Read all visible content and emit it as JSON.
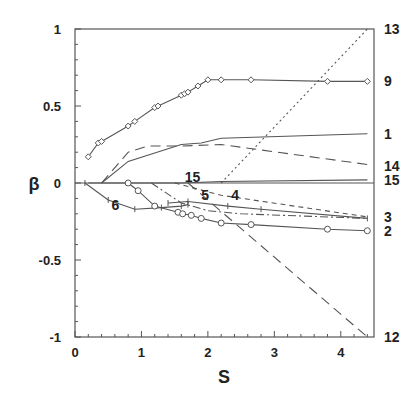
{
  "chart_data": {
    "type": "line",
    "title": "",
    "xlabel": "S",
    "ylabel": "β",
    "xlim": [
      0,
      4.5
    ],
    "ylim": [
      -1,
      1
    ],
    "x_ticks": [
      "0",
      "1",
      "2",
      "3",
      "4"
    ],
    "y_ticks": [
      "1",
      "0.5",
      "0",
      "-0.5",
      "-1"
    ],
    "grid": false,
    "legend": "curve labels at right edge and inline",
    "series": [
      {
        "name": "9",
        "style": "solid-diamond",
        "x": [
          0.2,
          0.35,
          0.4,
          0.8,
          0.9,
          1.2,
          1.25,
          1.6,
          1.65,
          1.7,
          1.85,
          2.0,
          2.2,
          2.65,
          3.8,
          4.4
        ],
        "y": [
          0.17,
          0.26,
          0.27,
          0.37,
          0.4,
          0.49,
          0.5,
          0.57,
          0.58,
          0.59,
          0.63,
          0.67,
          0.67,
          0.67,
          0.66,
          0.66
        ]
      },
      {
        "name": "1",
        "style": "solid",
        "x": [
          0.4,
          0.8,
          1.6,
          1.9,
          2.2,
          4.4
        ],
        "y": [
          0.0,
          0.14,
          0.25,
          0.26,
          0.29,
          0.32
        ]
      },
      {
        "name": "14",
        "style": "long-dash",
        "x": [
          0.4,
          0.8,
          1.1,
          1.6,
          2.2,
          4.4
        ],
        "y": [
          0.0,
          0.2,
          0.24,
          0.24,
          0.25,
          0.12
        ]
      },
      {
        "name": "15",
        "style": "solid",
        "x": [
          0.2,
          1.6,
          2.2,
          4.4
        ],
        "y": [
          0.0,
          0.0,
          0.01,
          0.02
        ]
      },
      {
        "name": "13",
        "style": "dotted",
        "x": [
          2.2,
          4.4
        ],
        "y": [
          0.0,
          1.0
        ]
      },
      {
        "name": "12",
        "style": "long-dash",
        "x": [
          1.7,
          4.4
        ],
        "y": [
          0.0,
          -1.0
        ]
      },
      {
        "name": "3",
        "style": "short-dash",
        "x": [
          1.5,
          2.2,
          4.4
        ],
        "y": [
          0.0,
          -0.08,
          -0.22
        ]
      },
      {
        "name": "4",
        "style": "solid-plus",
        "x": [
          1.4,
          1.7,
          2.3,
          2.8,
          4.4
        ],
        "y": [
          -0.13,
          -0.12,
          -0.15,
          -0.17,
          -0.23
        ]
      },
      {
        "name": "5",
        "style": "dash-dot",
        "x": [
          1.15,
          1.6,
          2.0,
          2.5,
          4.4
        ],
        "y": [
          0.0,
          -0.13,
          -0.18,
          -0.2,
          -0.23
        ]
      },
      {
        "name": "6",
        "style": "solid-plus",
        "x": [
          0.15,
          0.5,
          0.9,
          1.3,
          1.6,
          1.7
        ],
        "y": [
          0.0,
          -0.11,
          -0.17,
          -0.16,
          -0.15,
          -0.14
        ]
      },
      {
        "name": "2",
        "style": "solid-circle",
        "x": [
          0.8,
          0.95,
          1.2,
          1.55,
          1.62,
          1.75,
          1.9,
          2.2,
          2.65,
          3.8,
          4.4
        ],
        "y": [
          0.0,
          -0.05,
          -0.15,
          -0.19,
          -0.2,
          -0.21,
          -0.23,
          -0.26,
          -0.27,
          -0.3,
          -0.31
        ]
      }
    ],
    "right_labels": [
      {
        "text": "13",
        "y": 1.0
      },
      {
        "text": "9",
        "y": 0.66
      },
      {
        "text": "1",
        "y": 0.32
      },
      {
        "text": "14",
        "y": 0.11
      },
      {
        "text": "15",
        "y": 0.02
      },
      {
        "text": "3",
        "y": -0.22
      },
      {
        "text": "2",
        "y": -0.31
      },
      {
        "text": "12",
        "y": -1.0
      }
    ],
    "inline_labels": [
      {
        "text": "6",
        "x": 0.55,
        "y": -0.14
      },
      {
        "text": "15",
        "x": 1.65,
        "y": 0.04
      },
      {
        "text": "5",
        "x": 1.9,
        "y": -0.08
      },
      {
        "text": "4",
        "x": 2.35,
        "y": -0.08
      }
    ]
  }
}
